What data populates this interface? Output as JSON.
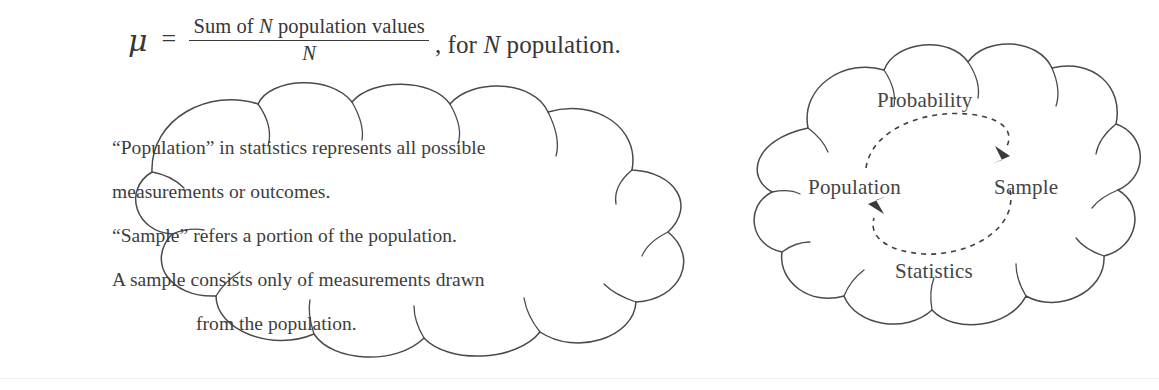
{
  "page": {
    "background_color": "#ffffff",
    "ink_color": "#3b3b3b",
    "stroke_color": "#4a4a4a"
  },
  "formula": {
    "symbol": "μ",
    "equals": "=",
    "numerator_prefix": "Sum of ",
    "numerator_variable": "N",
    "numerator_suffix": " population values",
    "denominator": "N",
    "tail_prefix": ", for ",
    "tail_variable": "N",
    "tail_suffix": " population."
  },
  "left_cloud": {
    "shape": "thought-cloud",
    "lines": [
      "“Population” in statistics represents all possible",
      "measurements or outcomes.",
      "“Sample” refers a portion of the population.",
      "A sample consists only of measurements drawn",
      "from the population."
    ]
  },
  "right_cloud": {
    "shape": "thought-cloud",
    "labels": {
      "top": "Probability",
      "left": "Population",
      "right": "Sample",
      "bottom": "Statistics"
    },
    "arrows": [
      {
        "name": "population-to-sample",
        "from": "Population",
        "to": "Sample",
        "style": "dashed",
        "position": "top"
      },
      {
        "name": "sample-to-population",
        "from": "Sample",
        "to": "Population",
        "style": "dashed",
        "position": "bottom"
      }
    ]
  }
}
